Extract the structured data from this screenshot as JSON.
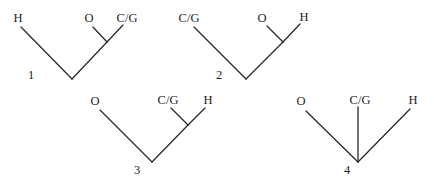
{
  "diagram": {
    "type": "tree-topologies",
    "trees": [
      {
        "number": "1",
        "leaves": [
          "H",
          "O",
          "C/G"
        ],
        "topology": "(H,(O,C/G))"
      },
      {
        "number": "2",
        "leaves": [
          "C/G",
          "O",
          "H"
        ],
        "topology": "(C/G,(O,H))"
      },
      {
        "number": "3",
        "leaves": [
          "O",
          "C/G",
          "H"
        ],
        "topology": "(O,(C/G,H))"
      },
      {
        "number": "4",
        "leaves": [
          "O",
          "C/G",
          "H"
        ],
        "topology": "(O,C/G,H)"
      }
    ]
  }
}
